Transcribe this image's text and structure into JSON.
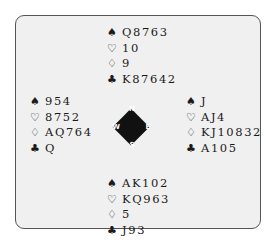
{
  "suit_symbols": {
    "spades": "♠",
    "hearts": "♡",
    "diamonds": "♢",
    "clubs": "♣"
  },
  "hands": {
    "north": {
      "spades": "Q8763",
      "hearts": "10",
      "diamonds": "9",
      "clubs": "K87642"
    },
    "west": {
      "spades": "954",
      "hearts": "8752",
      "diamonds": "AQ764",
      "clubs": "Q"
    },
    "east": {
      "spades": "J",
      "hearts": "AJ4",
      "diamonds": "KJ10832",
      "clubs": "A105"
    },
    "south": {
      "spades": "AK102",
      "hearts": "KQ963",
      "diamonds": "5",
      "clubs": "J93"
    }
  },
  "compass": {
    "n": "N",
    "s": "S",
    "w": "W",
    "e": "E"
  }
}
